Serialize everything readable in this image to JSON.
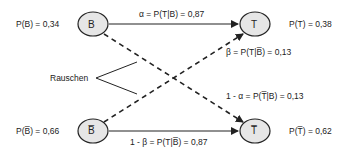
{
  "nodes": {
    "B": {
      "label": "B",
      "prob": "P(B) = 0,34"
    },
    "T": {
      "label": "T",
      "prob": "P(T) = 0,38"
    },
    "B_bar": {
      "label": "B̅",
      "prob": "P(B̅) = 0,66"
    },
    "T_bar": {
      "label": "T̅",
      "prob": "P(T̅) = 0,62"
    }
  },
  "edges": {
    "alpha": "α = P(T|B) = 0,87",
    "beta": "β = P(T|B̅) = 0,13",
    "one_minus_alpha": "1 - α = P(T̅|B) = 0,13",
    "one_minus_beta": "1 - β = P(T|B̅) = 0,87"
  },
  "noise_label": "Rauschen",
  "colors": {
    "node_fill": "#e6e6e6",
    "stroke": "#222222"
  }
}
